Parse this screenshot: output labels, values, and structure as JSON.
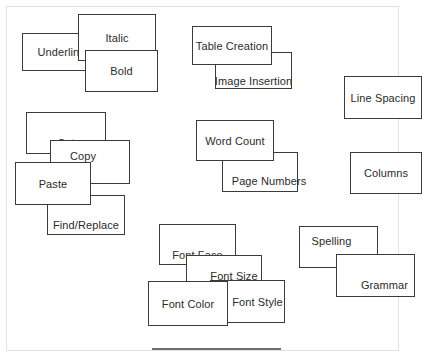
{
  "diagram": {
    "background_color": "#ffffff",
    "box_fill_color": "#ffffff",
    "box_border_color": "#3b3b3b",
    "label_color": "#2b2b2b",
    "frame_color": "#e2e2e2",
    "rule_color": "#6e6e6e"
  },
  "nodes": [
    {
      "id": "italic",
      "label": "Italic",
      "x": 78,
      "y": 14,
      "w": 78,
      "h": 47,
      "z": 2
    },
    {
      "id": "underline",
      "label": "Underline",
      "x": 22,
      "y": 33,
      "w": 79,
      "h": 38,
      "z": 1
    },
    {
      "id": "bold",
      "label": "Bold",
      "x": 85,
      "y": 50,
      "w": 73,
      "h": 42,
      "z": 3
    },
    {
      "id": "table-creation",
      "label": "Table Creation",
      "x": 192,
      "y": 26,
      "w": 80,
      "h": 39,
      "z": 2
    },
    {
      "id": "image-insertion",
      "label": "Image Insertion",
      "x": 215,
      "y": 52,
      "w": 77,
      "h": 37,
      "z": 1
    },
    {
      "id": "line-spacing",
      "label": "Line Spacing",
      "x": 344,
      "y": 76,
      "w": 78,
      "h": 43,
      "z": 1
    },
    {
      "id": "cut",
      "label": "Cut",
      "x": 26,
      "y": 112,
      "w": 80,
      "h": 42,
      "z": 1
    },
    {
      "id": "copy",
      "label": "Copy",
      "x": 50,
      "y": 140,
      "w": 80,
      "h": 44,
      "z": 2
    },
    {
      "id": "paste",
      "label": "Paste",
      "x": 15,
      "y": 162,
      "w": 76,
      "h": 43,
      "z": 4
    },
    {
      "id": "find-replace",
      "label": "Find/Replace",
      "x": 47,
      "y": 195,
      "w": 78,
      "h": 40,
      "z": 3
    },
    {
      "id": "word-count",
      "label": "Word Count",
      "x": 196,
      "y": 120,
      "w": 78,
      "h": 41,
      "z": 2
    },
    {
      "id": "page-numbers",
      "label": "Page Numbers",
      "x": 222,
      "y": 152,
      "w": 76,
      "h": 40,
      "z": 1
    },
    {
      "id": "columns",
      "label": "Columns",
      "x": 350,
      "y": 152,
      "w": 72,
      "h": 42,
      "z": 1
    },
    {
      "id": "font-face",
      "label": "Font Face",
      "x": 159,
      "y": 224,
      "w": 77,
      "h": 41,
      "z": 1
    },
    {
      "id": "font-size",
      "label": "Font Size",
      "x": 186,
      "y": 255,
      "w": 76,
      "h": 42,
      "z": 2
    },
    {
      "id": "font-style",
      "label": "Font Style",
      "x": 210,
      "y": 280,
      "w": 75,
      "h": 43,
      "z": 3
    },
    {
      "id": "font-color",
      "label": "Font Color",
      "x": 148,
      "y": 281,
      "w": 80,
      "h": 45,
      "z": 4
    },
    {
      "id": "spelling",
      "label": "Spelling",
      "x": 299,
      "y": 226,
      "w": 79,
      "h": 42,
      "z": 1
    },
    {
      "id": "grammar",
      "label": "Grammar",
      "x": 336,
      "y": 254,
      "w": 79,
      "h": 43,
      "z": 2
    }
  ],
  "rule": {
    "x": 152,
    "y": 348,
    "w": 129
  }
}
